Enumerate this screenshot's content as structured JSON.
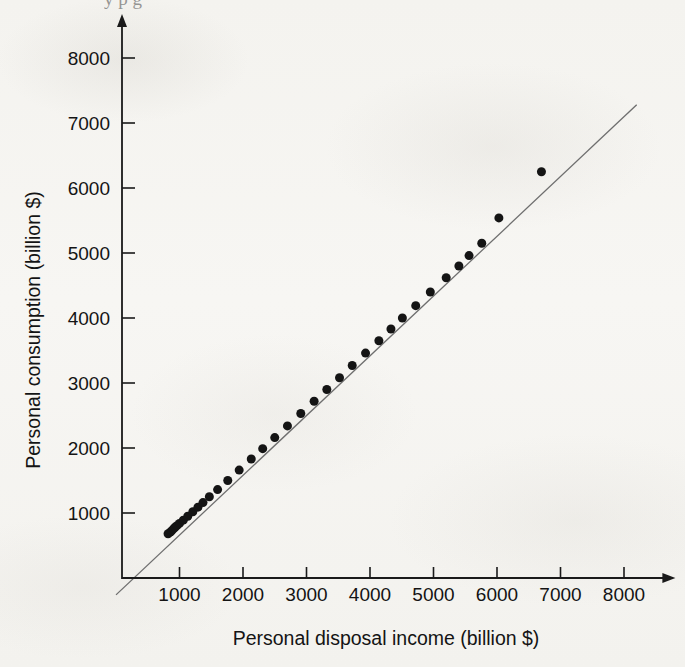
{
  "figure": {
    "background_color": "#f6f5f2",
    "marker_color": "#141414",
    "line_color": "#6e6e6e",
    "axis_color": "#1a1a1a",
    "bleed_through_text": "y p g"
  },
  "chart_data": {
    "type": "scatter",
    "title": "",
    "xlabel": "Personal disposal income (billion $)",
    "ylabel": "Personal consumption (billion $)",
    "xlim": [
      0,
      8400
    ],
    "ylim": [
      0,
      8400
    ],
    "xticks": [
      1000,
      2000,
      3000,
      4000,
      5000,
      6000,
      7000,
      8000
    ],
    "yticks": [
      1000,
      2000,
      3000,
      4000,
      5000,
      6000,
      7000,
      8000
    ],
    "xticklabels": [
      "1000",
      "2000",
      "3000",
      "4000",
      "5000",
      "6000",
      "7000",
      "8000"
    ],
    "yticklabels": [
      "1000",
      "2000",
      "3000",
      "4000",
      "5000",
      "6000",
      "7000",
      "8000"
    ],
    "grid": false,
    "legend": false,
    "axis_style": "arrow-tipped open axes",
    "series": [
      {
        "name": "Personal consumption vs disposal income",
        "marker": "filled-circle",
        "marker_size_px": 9,
        "x": [
          820,
          855,
          875,
          905,
          930,
          960,
          1000,
          1060,
          1130,
          1210,
          1290,
          1370,
          1470,
          1600,
          1760,
          1940,
          2130,
          2310,
          2500,
          2700,
          2910,
          3120,
          3320,
          3520,
          3720,
          3930,
          4140,
          4330,
          4510,
          4720,
          4950,
          5200,
          5400,
          5560,
          5760,
          6030,
          6700
        ],
        "y": [
          680,
          705,
          725,
          755,
          780,
          805,
          840,
          890,
          950,
          1020,
          1090,
          1160,
          1250,
          1360,
          1500,
          1660,
          1830,
          1990,
          2160,
          2340,
          2530,
          2720,
          2900,
          3080,
          3270,
          3460,
          3650,
          3830,
          4000,
          4190,
          4400,
          4620,
          4800,
          4960,
          5150,
          5540,
          6250
        ]
      }
    ],
    "fit_line": {
      "name": "fitted regression line",
      "x_start": 0,
      "y_start": -260,
      "x_end": 8200,
      "y_end": 7280
    },
    "annotations": [
      {
        "text": "topmost-right point falls below the fitted line",
        "x": 6700,
        "y": 6250
      }
    ]
  }
}
